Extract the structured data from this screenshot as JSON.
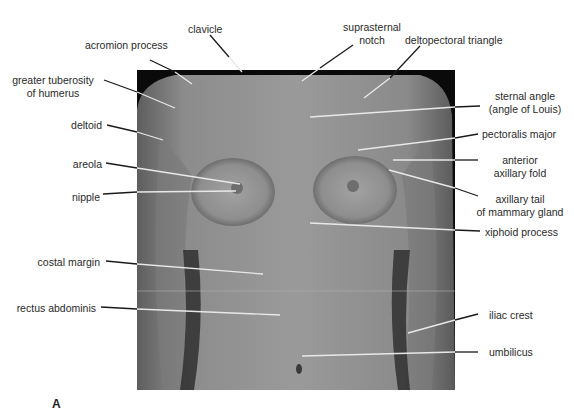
{
  "figure": {
    "panel_label": "A",
    "colors": {
      "background": "#ffffff",
      "photo_backdrop": "#0a0a0a",
      "skin_tone": "#8a8a8a",
      "leader_line": "#1a1a1a",
      "leader_line_on_photo": "#e8e8e8",
      "label_text": "#2a2a2a"
    }
  },
  "labels": {
    "clavicle": "clavicle",
    "acromion_process": "acromion process",
    "suprasternal_notch_1": "suprasternal",
    "suprasternal_notch_2": "notch",
    "deltopectoral_triangle": "deltopectoral triangle",
    "greater_tuberosity_1": "greater tuberosity",
    "greater_tuberosity_2": "of humerus",
    "sternal_angle_1": "sternal angle",
    "sternal_angle_2": "(angle of Louis)",
    "deltoid": "deltoid",
    "pectoralis_major": "pectoralis major",
    "anterior_axillary_fold_1": "anterior",
    "anterior_axillary_fold_2": "axillary fold",
    "areola": "areola",
    "nipple": "nipple",
    "axillary_tail_1": "axillary tail",
    "axillary_tail_2": "of mammary gland",
    "xiphoid_process": "xiphoid process",
    "costal_margin": "costal margin",
    "rectus_abdominis": "rectus abdominis",
    "iliac_crest": "iliac crest",
    "umbilicus": "umbilicus"
  }
}
